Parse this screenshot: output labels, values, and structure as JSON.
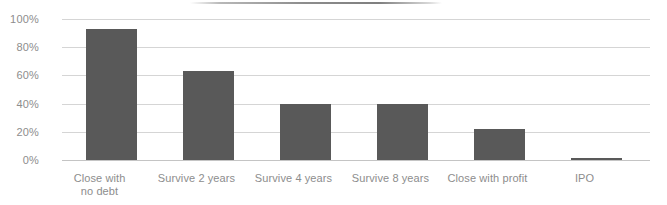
{
  "chart_data": {
    "type": "bar",
    "title": "",
    "subtitle": "",
    "xlabel": "",
    "ylabel": "",
    "categories": [
      "Close with\nno debt",
      "Survive 2 years",
      "Survive 4 years",
      "Survive 8 years",
      "Close with profit",
      "IPO"
    ],
    "category_lines": [
      [
        "Close with",
        "no debt"
      ],
      [
        "Survive 2 years"
      ],
      [
        "Survive 4 years"
      ],
      [
        "Survive 8 years"
      ],
      [
        "Close with profit"
      ],
      [
        "IPO"
      ]
    ],
    "values": [
      93,
      63,
      40,
      40,
      22,
      1.5
    ],
    "value_labels": [
      "93%",
      "63%",
      "40%",
      "40%",
      "22%",
      "1.5%"
    ],
    "ylim": [
      0,
      100
    ],
    "ytick_values": [
      0,
      20,
      40,
      60,
      80,
      100
    ],
    "ytick_labels": [
      "0%",
      "20%",
      "40%",
      "60%",
      "80%",
      "100%"
    ],
    "grid": true,
    "grid_axis": "y",
    "legend": false,
    "legend_position": "none",
    "series": [
      {
        "name": "Share of respondents",
        "values": [
          93,
          63,
          40,
          40,
          22,
          1.5
        ]
      }
    ]
  },
  "colors": {
    "bar": "#595959",
    "gridline": "#d5d5d5",
    "baseline": "#c4c4c4",
    "tick_label": "#8d8d8d",
    "background": "#ffffff",
    "top_rule": "#8d8d8d"
  },
  "annotations": {
    "top_rule_present": true
  }
}
